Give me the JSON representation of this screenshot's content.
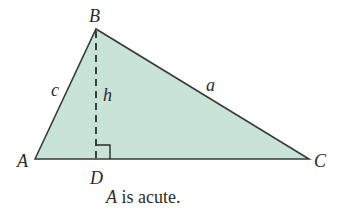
{
  "diagram": {
    "type": "triangle",
    "fill_color": "#c8e4d6",
    "stroke_color": "#3a3a3a",
    "vertices": {
      "A": {
        "label": "A",
        "x": 35,
        "y": 159
      },
      "B": {
        "label": "B",
        "x": 96,
        "y": 29
      },
      "C": {
        "label": "C",
        "x": 309,
        "y": 159
      },
      "D": {
        "label": "D",
        "x": 96,
        "y": 159
      }
    },
    "sides": {
      "a": {
        "label": "a"
      },
      "c": {
        "label": "c"
      }
    },
    "altitude": {
      "label": "h",
      "style": "dashed",
      "from": "B",
      "to": "D"
    },
    "right_angle_marker": true
  },
  "caption": {
    "var": "A",
    "text": " is acute."
  }
}
